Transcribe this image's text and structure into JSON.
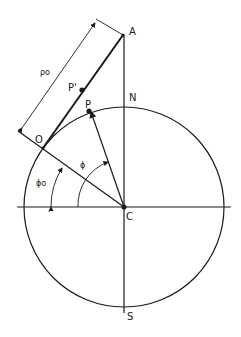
{
  "diagram": {
    "labels": {
      "A": "A",
      "N": "N",
      "P": "P",
      "P_prime": "P'",
      "O": "O",
      "C": "C",
      "S": "S",
      "rho0": "ρo",
      "phi": "ϕ",
      "phi0": "ϕo"
    },
    "colors": {
      "ink": "#1a1a1a",
      "background": "#ffffff"
    }
  }
}
